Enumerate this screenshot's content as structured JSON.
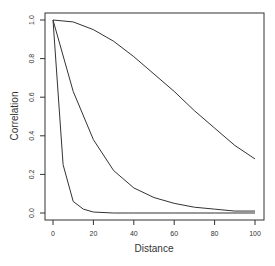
{
  "chart_data": {
    "type": "line",
    "title": "",
    "xlabel": "Distance",
    "ylabel": "Correlation",
    "xlim": [
      0,
      100
    ],
    "ylim": [
      0,
      1
    ],
    "xticks": [
      "0",
      "20",
      "40",
      "60",
      "80",
      "100"
    ],
    "yticks": [
      "0.0",
      "0.2",
      "0.4",
      "0.6",
      "0.8",
      "1.0"
    ],
    "grid": false,
    "series": [
      {
        "name": "slow",
        "x": [
          0,
          10,
          20,
          30,
          40,
          50,
          60,
          70,
          80,
          90,
          100
        ],
        "values": [
          1.0,
          0.99,
          0.95,
          0.89,
          0.81,
          0.72,
          0.63,
          0.53,
          0.44,
          0.35,
          0.28
        ]
      },
      {
        "name": "medium",
        "x": [
          0,
          10,
          20,
          30,
          40,
          50,
          60,
          70,
          80,
          90,
          100
        ],
        "values": [
          1.0,
          0.63,
          0.38,
          0.22,
          0.13,
          0.08,
          0.05,
          0.03,
          0.02,
          0.01,
          0.01
        ]
      },
      {
        "name": "fast",
        "x": [
          0,
          5,
          10,
          15,
          20,
          30,
          40,
          60,
          80,
          100
        ],
        "values": [
          1.0,
          0.25,
          0.06,
          0.02,
          0.005,
          0.0,
          0.0,
          0.0,
          0.0,
          0.0
        ]
      }
    ]
  }
}
